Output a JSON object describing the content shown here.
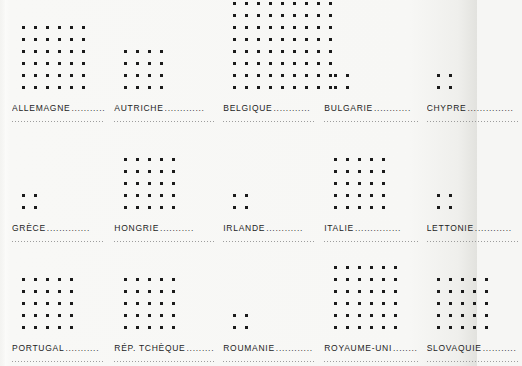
{
  "chart_data": {
    "type": "bar",
    "title": "",
    "subtitle": "",
    "xlabel": "",
    "ylabel": "",
    "unit_glyph": "square-dot",
    "grid": {
      "columns": 5,
      "rows": 3
    },
    "categories": [
      "ALLEMAGNE",
      "AUTRICHE",
      "BELGIQUE",
      "BULGARIE",
      "CHYPRE",
      "GRÈCE",
      "HONGRIE",
      "IRLANDE",
      "ITALIE",
      "LETTONIE",
      "PORTUGAL",
      "RÉP. TCHÈQUE",
      "ROUMANIE",
      "ROYAUME-UNI",
      "SLOVAQUIE"
    ],
    "values": [
      36,
      16,
      81,
      4,
      4,
      4,
      25,
      4,
      25,
      4,
      25,
      25,
      4,
      36,
      25
    ],
    "legend_position": "none",
    "grid_lines": false
  },
  "panels": [
    {
      "label": "ALLEMAGNE",
      "leader": "...........",
      "cols": 6,
      "rows": 6,
      "value": 36
    },
    {
      "label": "AUTRICHE",
      "leader": ".............",
      "cols": 4,
      "rows": 4,
      "value": 16
    },
    {
      "label": "BELGIQUE",
      "leader": "............",
      "cols": 9,
      "rows": 9,
      "value": 81
    },
    {
      "label": "BULGARIE",
      "leader": "............",
      "cols": 2,
      "rows": 2,
      "value": 4
    },
    {
      "label": "CHYPRE",
      "leader": "...............",
      "cols": 2,
      "rows": 2,
      "value": 4
    },
    {
      "label": "GRÈCE",
      "leader": "..............",
      "cols": 2,
      "rows": 2,
      "value": 4
    },
    {
      "label": "HONGRIE",
      "leader": "...........",
      "cols": 5,
      "rows": 5,
      "value": 25
    },
    {
      "label": "IRLANDE",
      "leader": "............",
      "cols": 2,
      "rows": 2,
      "value": 4
    },
    {
      "label": "ITALIE",
      "leader": "...............",
      "cols": 5,
      "rows": 5,
      "value": 25
    },
    {
      "label": "LETTONIE",
      "leader": "............",
      "cols": 2,
      "rows": 2,
      "value": 4
    },
    {
      "label": "PORTUGAL",
      "leader": "...........",
      "cols": 5,
      "rows": 5,
      "value": 25
    },
    {
      "label": "RÉP. TCHÈQUE",
      "leader": ".........",
      "cols": 5,
      "rows": 5,
      "value": 25
    },
    {
      "label": "ROUMANIE",
      "leader": "............",
      "cols": 2,
      "rows": 2,
      "value": 4
    },
    {
      "label": "ROYAUME-UNI",
      "leader": "........",
      "cols": 6,
      "rows": 6,
      "value": 36
    },
    {
      "label": "SLOVAQUIE",
      "leader": "...........",
      "cols": 5,
      "rows": 5,
      "value": 25
    }
  ],
  "colors": {
    "dot": "#1b1b1b",
    "text": "#1d1d1d",
    "rule": "#8d8d8d",
    "background": "#f7f7f5"
  }
}
